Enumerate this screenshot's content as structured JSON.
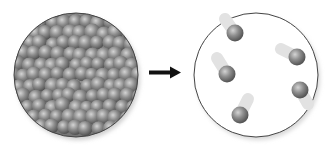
{
  "diagram": {
    "left_panel": {
      "label": "",
      "state": "densely packed particles",
      "particle_color": "#8a8a8a"
    },
    "arrow": {
      "direction": "right",
      "color": "#111111"
    },
    "right_panel": {
      "label": "",
      "state": "sparse moving particles",
      "particle_count": 5,
      "particles": [
        {
          "x": 235,
          "y": 33
        },
        {
          "x": 297,
          "y": 57
        },
        {
          "x": 227,
          "y": 74
        },
        {
          "x": 300,
          "y": 90
        },
        {
          "x": 240,
          "y": 115
        }
      ]
    }
  }
}
